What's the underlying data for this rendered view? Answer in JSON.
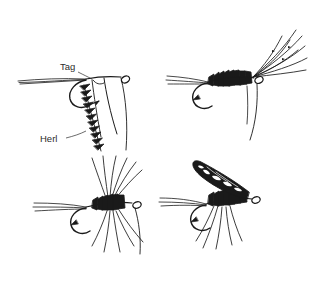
{
  "figure": {
    "background_color": "#ffffff",
    "ink_color": "#1a1a1a",
    "label_color": "#2b2b2b"
  },
  "labels": {
    "tag": "Tag",
    "herl": "Herl"
  },
  "panels": [
    {
      "id": "panel-top-left",
      "name": "tag-and-herl-stage",
      "caption_labels": [
        "Tag",
        "Herl"
      ]
    },
    {
      "id": "panel-top-right",
      "name": "wing-fibers-stage",
      "caption_labels": []
    },
    {
      "id": "panel-bottom-left",
      "name": "hackle-stage",
      "caption_labels": []
    },
    {
      "id": "panel-bottom-right",
      "name": "finished-fly-stage",
      "caption_labels": []
    }
  ]
}
